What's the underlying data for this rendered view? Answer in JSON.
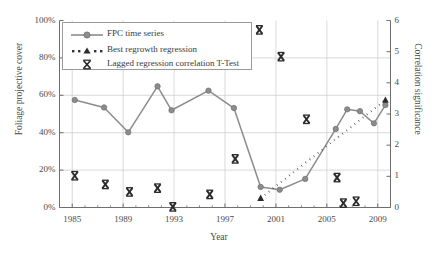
{
  "chart_data": {
    "type": "line",
    "title": "",
    "xlabel": "Year",
    "ylabel": "Foliage projective cover",
    "ylabel_right": "Correlation significance",
    "xlim": [
      1984,
      2010
    ],
    "ylim": [
      0,
      100
    ],
    "ylim_right": [
      0,
      6
    ],
    "grid": true,
    "legend_position": "top-left",
    "xticks": [
      "1985",
      "1989",
      "1993",
      "1997",
      "2001",
      "2005",
      "2009"
    ],
    "xtick_values": [
      1985,
      1989,
      1993,
      1997,
      2001,
      2005,
      2009
    ],
    "yticks_left": [
      "0%",
      "20%",
      "40%",
      "60%",
      "80%",
      "100%"
    ],
    "ytick_values_left": [
      0,
      20,
      40,
      60,
      80,
      100
    ],
    "yticks_right": [
      "0",
      "1",
      "2",
      "3",
      "4",
      "5",
      "6"
    ],
    "ytick_values_right": [
      0,
      1,
      2,
      3,
      4,
      5,
      6
    ],
    "series": [
      {
        "name": "FPC time series",
        "axis": "left",
        "type": "line-marker",
        "color": "#8c8c8c",
        "marker": "circle",
        "x": [
          1985.2,
          1987.5,
          1989.4,
          1991.7,
          1992.8,
          1995.7,
          1997.7,
          1999.8,
          2001.3,
          2003.3,
          2005.7,
          2006.6,
          2007.6,
          2008.7,
          2009.6
        ],
        "y": [
          57.5,
          53.5,
          40.2,
          64.8,
          52.0,
          62.5,
          53.2,
          11.0,
          9.5,
          15.3,
          42.0,
          52.5,
          51.5,
          45.0,
          54.8
        ]
      },
      {
        "name": "Best regrowth regression",
        "axis": "right",
        "type": "dotted-line",
        "color": "#333333",
        "marker": "triangle",
        "x": [
          1999.8,
          2009.6
        ],
        "y": [
          0.3,
          3.45
        ]
      },
      {
        "name": "Lagged regression correlation T-Test",
        "axis": "right",
        "type": "scatter",
        "color": "#2b2b2b",
        "marker": "x-bold",
        "x": [
          1985.2,
          1987.6,
          1989.5,
          1991.7,
          1992.9,
          1995.8,
          1997.8,
          1999.7,
          2001.4,
          2003.4,
          2005.8,
          2006.3,
          2007.3
        ],
        "y": [
          1.02,
          0.74,
          0.5,
          0.62,
          0.02,
          0.42,
          1.56,
          5.7,
          4.84,
          2.83,
          0.96,
          0.14,
          0.2
        ]
      }
    ]
  },
  "legend": {
    "items": [
      {
        "label": "FPC time series",
        "symbol": "line-circle"
      },
      {
        "label": "Best regrowth regression",
        "symbol": "dotted-triangle"
      },
      {
        "label": "Lagged regression correlation T-Test",
        "symbol": "x-marker"
      }
    ]
  },
  "colors": {
    "fpc_line": "#8c8c8c",
    "regression": "#333333",
    "ttest_marker": "#2b2b2b",
    "grid": "#c9c9c9",
    "axis": "#6e6e6e",
    "text": "#3a3a3a"
  }
}
